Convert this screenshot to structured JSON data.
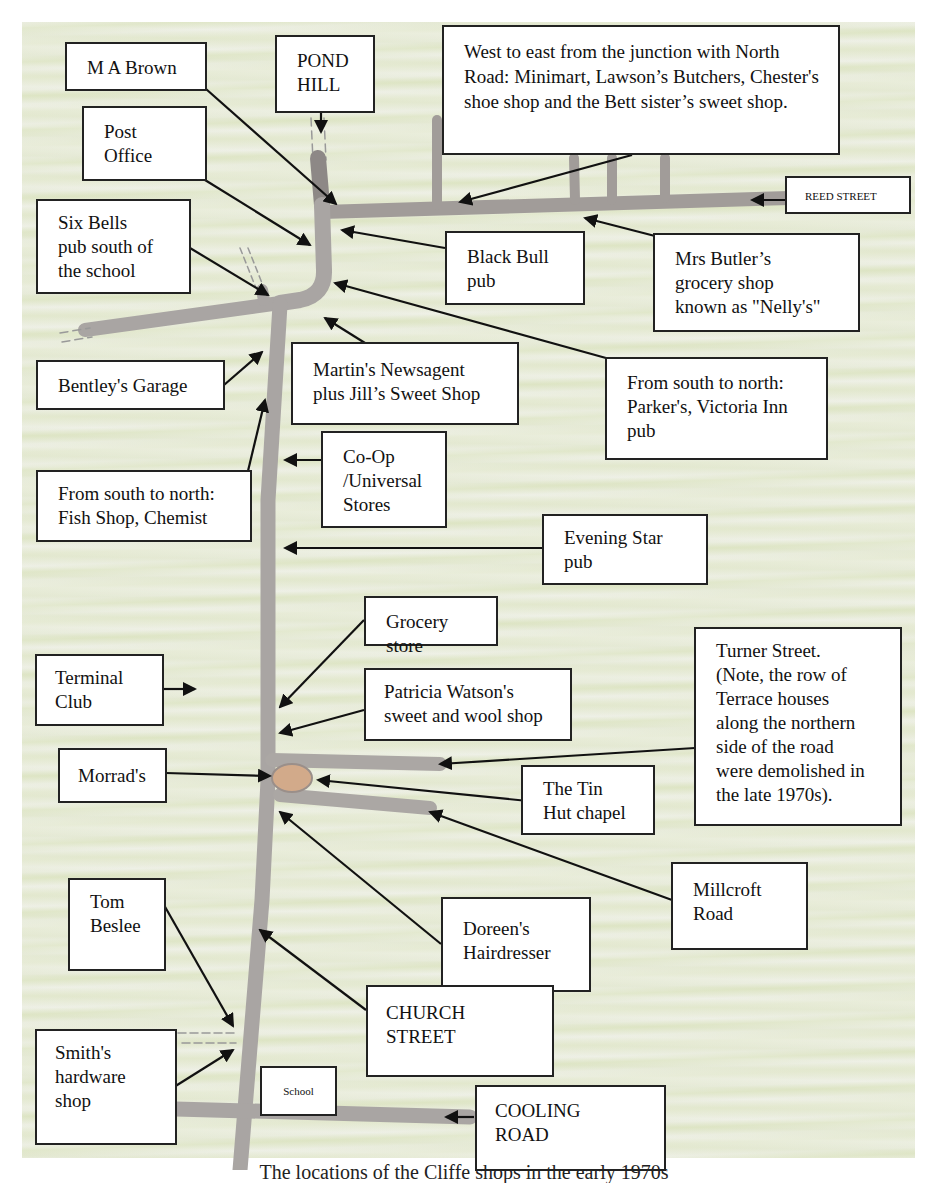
{
  "map": {
    "colors": {
      "paper": "#eef0e6",
      "road": "#a9a5a3",
      "road_edge": "#8d8886",
      "chapel": "#d2aa8a",
      "label_border": "#222222",
      "arrow": "#111111"
    },
    "labels": {
      "ma_brown": "M A Brown",
      "pond_hill": "POND\nHILL",
      "reed_shops": "West to east from the junction with North Road: Minimart, Lawson’s Butchers, Chester's shoe shop and the Bett sister’s sweet shop.",
      "post_office": "Post\nOffice",
      "reed_street": "REED STREET",
      "six_bells": "Six Bells\npub south of\nthe school",
      "black_bull": "Black Bull\npub",
      "mrs_butler": "Mrs Butler’s\ngrocery shop\nknown as \"Nelly's\"",
      "bentleys": "Bentley's Garage",
      "martins": "Martin's Newsagent\nplus Jill’s Sweet Shop",
      "parkers": "From south to north:\nParker's, Victoria Inn\npub",
      "co_op": "Co-Op\n/Universal\nStores",
      "fish_shop": "From south to north:\nFish Shop, Chemist",
      "evening_star": "Evening Star\npub",
      "grocery_store": "Grocery store",
      "terminal_club": "Terminal\nClub",
      "patricia_watson": "Patricia Watson's\nsweet and wool shop",
      "turner_street": "Turner Street.\n(Note, the row of\nTerrace houses\nalong the northern\nside of the road\nwere demolished in\nthe late 1970s).",
      "morrads": "Morrad's",
      "tin_hut": "The Tin\nHut chapel",
      "millcroft": "Millcroft\nRoad",
      "tom_beslee": "Tom\nBeslee",
      "doreens": "Doreen's\nHairdresser",
      "church_street": "CHURCH\nSTREET",
      "smiths": "Smith's\nhardware\nshop",
      "school": "School",
      "cooling_road": "COOLING\nROAD"
    },
    "caption": "The locations of the Cliffe shops in the early 1970s"
  }
}
